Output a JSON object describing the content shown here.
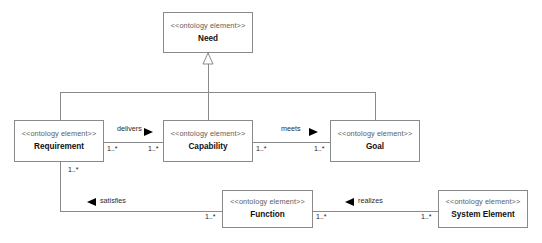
{
  "diagram": {
    "stereotype": "<<ontology element>>",
    "nodes": [
      {
        "id": "need",
        "name": "Need",
        "x": 163,
        "y": 12,
        "w": 90,
        "h": 41
      },
      {
        "id": "req",
        "name": "Requirement",
        "x": 14,
        "y": 120,
        "w": 90,
        "h": 42
      },
      {
        "id": "cap",
        "name": "Capability",
        "x": 163,
        "y": 120,
        "w": 90,
        "h": 42
      },
      {
        "id": "goal",
        "name": "Goal",
        "x": 330,
        "y": 120,
        "w": 90,
        "h": 42
      },
      {
        "id": "func",
        "name": "Function",
        "x": 222,
        "y": 190,
        "w": 91,
        "h": 38
      },
      {
        "id": "syselem",
        "name": "System Element",
        "x": 438,
        "y": 190,
        "w": 90,
        "h": 38
      }
    ],
    "associations": [
      {
        "id": "delivers",
        "label": "delivers",
        "source": "Requirement",
        "target": "Capability",
        "source_mult": "1..*",
        "target_mult": "1..*",
        "arrow": "right"
      },
      {
        "id": "meets",
        "label": "meets",
        "source": "Capability",
        "target": "Goal",
        "source_mult": "1..*",
        "target_mult": "1..*",
        "arrow": "right"
      },
      {
        "id": "satisfies",
        "label": "satisfies",
        "source": "Function",
        "target": "Requirement",
        "source_mult": "1..*",
        "target_mult": "1..*",
        "arrow": "left"
      },
      {
        "id": "realizes",
        "label": "realizes",
        "source": "System Element",
        "target": "Function",
        "source_mult": "1..*",
        "target_mult": "1..*",
        "arrow": "left"
      }
    ],
    "generalizations": [
      {
        "id": "req-need",
        "source": "Requirement",
        "target": "Need",
        "arrow": "hollow-triangle"
      },
      {
        "id": "cap-need",
        "source": "Capability",
        "target": "Need",
        "arrow": "hollow-triangle"
      },
      {
        "id": "goal-need",
        "source": "Goal",
        "target": "Need",
        "arrow": "hollow-triangle"
      }
    ],
    "labels": {
      "delivers": {
        "x": 117,
        "y": 131
      },
      "meets": {
        "x": 281,
        "y": 131
      },
      "satisfies": {
        "x": 100,
        "y": 198
      },
      "realizes": {
        "x": 358,
        "y": 198
      }
    },
    "multiplicities": [
      {
        "id": "req-right",
        "text": "1..*",
        "x": 107,
        "y": 145
      },
      {
        "id": "cap-left",
        "text": "1..*",
        "x": 148,
        "y": 145
      },
      {
        "id": "cap-right",
        "text": "1..*",
        "x": 256,
        "y": 145
      },
      {
        "id": "goal-left",
        "text": "1..*",
        "x": 314,
        "y": 145
      },
      {
        "id": "req-bottom",
        "text": "1..*",
        "x": 68,
        "y": 166
      },
      {
        "id": "func-left",
        "text": "1..*",
        "x": 205,
        "y": 213
      },
      {
        "id": "func-right",
        "text": "1..*",
        "x": 316,
        "y": 213
      },
      {
        "id": "sys-left",
        "text": "1..*",
        "x": 421,
        "y": 213
      }
    ],
    "colors": {
      "line": "#8a8a8a",
      "node_border": "#8a8a8a",
      "node_fill": "#ffffff",
      "stereotype_text": "#5d5d5d",
      "name_text": "#111111",
      "arrow_fill": "#000000",
      "background": "#ffffff"
    }
  }
}
